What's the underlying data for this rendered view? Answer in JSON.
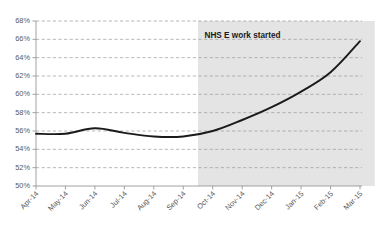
{
  "chart_data": {
    "type": "line",
    "title": "",
    "subtitle": "",
    "xlabel": "",
    "ylabel": "",
    "categories": [
      "Apr-14",
      "May-14",
      "Jun-14",
      "Jul-14",
      "Aug-14",
      "Sep-14",
      "Oct-14",
      "Nov-14",
      "Dec-14",
      "Jan-15",
      "Feb-15",
      "Mar-15"
    ],
    "series": [
      {
        "name": "",
        "values": [
          55.7,
          55.7,
          56.3,
          55.8,
          55.4,
          55.4,
          56.0,
          57.2,
          58.6,
          60.3,
          62.4,
          65.8
        ],
        "color": "#1a1a1a"
      }
    ],
    "ylim": [
      50,
      68
    ],
    "ytick_step": 2,
    "ytick_labels": [
      "50%",
      "52%",
      "54%",
      "56%",
      "58%",
      "60%",
      "62%",
      "64%",
      "66%",
      "68%"
    ],
    "ytick_values": [
      50,
      52,
      54,
      56,
      58,
      60,
      62,
      64,
      66,
      68
    ],
    "grid": true,
    "grid_style": "dashed-horizontal",
    "legend": false,
    "legend_position": "none",
    "annotations": [
      {
        "text": "NHS E work started",
        "type": "shaded-region-label",
        "region_start_category": "Oct-14",
        "region_end_category": "Mar-15",
        "region_color": "#d9d9d9"
      }
    ],
    "axis_color": "#8c8c8c",
    "gridline_color": "#9a9a9a",
    "tick_label_color": "#595959",
    "background_color": "#ffffff",
    "xtick_label_rotation": -45
  }
}
